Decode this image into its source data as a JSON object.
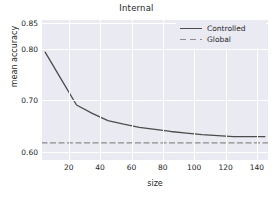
{
  "chart_data": {
    "type": "line",
    "title": "Internal",
    "xlabel": "size",
    "ylabel": "mean accuracy",
    "xlim": [
      3,
      147
    ],
    "ylim": [
      0.585,
      0.855
    ],
    "xticks": [
      20,
      40,
      60,
      80,
      100,
      120,
      140
    ],
    "xticklabels": [
      "20",
      "40",
      "60",
      "80",
      "100",
      "120",
      "140"
    ],
    "yticks": [
      0.6,
      0.7,
      0.8,
      0.85
    ],
    "yticklabels": [
      "0.60",
      "0.70",
      "0.80",
      "0.85"
    ],
    "grid": true,
    "legend_position": "upper right",
    "series": [
      {
        "name": "Controlled",
        "style": "solid",
        "color": "#4c4c4c",
        "x": [
          5,
          15,
          25,
          35,
          45,
          55,
          65,
          75,
          85,
          95,
          105,
          115,
          125,
          135,
          145
        ],
        "y": [
          0.793,
          0.742,
          0.691,
          0.675,
          0.661,
          0.654,
          0.648,
          0.644,
          0.64,
          0.637,
          0.634,
          0.632,
          0.63,
          0.63,
          0.63
        ]
      },
      {
        "name": "Global",
        "style": "dashed",
        "color": "#8c8c8c",
        "x": [
          3,
          147
        ],
        "y": [
          0.618,
          0.618
        ]
      }
    ]
  },
  "legend": {
    "entries": [
      {
        "label": "Controlled"
      },
      {
        "label": "Global"
      }
    ]
  },
  "colors": {
    "plot_background": "#eaeaf2",
    "grid": "#ffffff",
    "text": "#262626",
    "controlled_line": "#4c4c4c",
    "global_line": "#8c8c8c"
  }
}
